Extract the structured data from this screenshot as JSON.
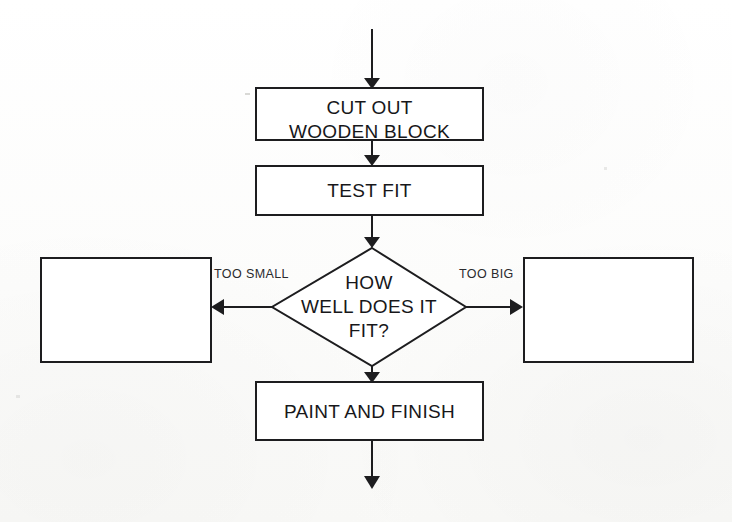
{
  "diagram": {
    "type": "flowchart",
    "stroke_color": "#1d1d1f",
    "background_color": "#fdfdfc",
    "nodes": [
      {
        "id": "cut-out-wooden-block",
        "shape": "process",
        "label": "CUT OUT\nWOODEN BLOCK"
      },
      {
        "id": "test-fit",
        "shape": "process",
        "label": "TEST FIT"
      },
      {
        "id": "how-well-does-it-fit",
        "shape": "decision",
        "label": "HOW\nWELL DOES IT\nFIT?"
      },
      {
        "id": "too-small-outcome",
        "shape": "process",
        "label": ""
      },
      {
        "id": "too-big-outcome",
        "shape": "process",
        "label": ""
      },
      {
        "id": "paint-and-finish",
        "shape": "process",
        "label": "PAINT AND FINISH"
      }
    ],
    "edge_labels": {
      "too_small": "TOO SMALL",
      "too_big": "TOO BIG"
    }
  }
}
